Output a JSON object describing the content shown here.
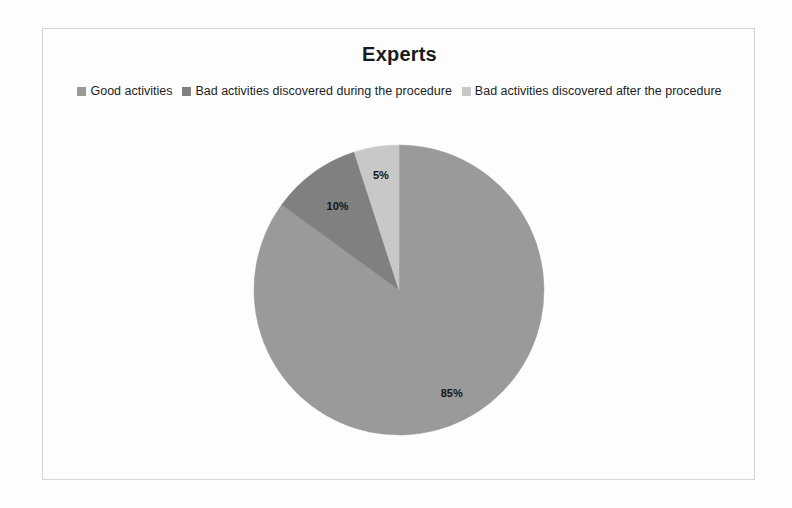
{
  "frame": {
    "border_color": "#d4d4d8",
    "background": "#ffffff"
  },
  "chart": {
    "title": "Experts"
  },
  "legend": {
    "position": "top",
    "entries": [
      {
        "label": "Good activities",
        "color": "#9a9a9a",
        "marker": "square-swatch-icon"
      },
      {
        "label": "Bad activities discovered during the procedure",
        "color": "#808080",
        "marker": "square-swatch-icon"
      },
      {
        "label": "Bad activities discovered after the procedure",
        "color": "#c8c8c8",
        "marker": "square-swatch-icon"
      }
    ]
  },
  "chart_data": {
    "type": "pie",
    "title": "Experts",
    "xlabel": "",
    "ylabel": "",
    "categories": [
      "Good activities",
      "Bad activities discovered during the procedure",
      "Bad activities discovered after the procedure"
    ],
    "values": [
      85,
      10,
      5
    ],
    "unit": "%",
    "data_labels": [
      "85%",
      "10%",
      "5%"
    ],
    "colors": [
      "#9a9a9a",
      "#808080",
      "#c8c8c8"
    ],
    "legend_position": "top",
    "grid": false,
    "start_angle_deg": 0,
    "direction": "clockwise",
    "slices": [
      {
        "name": "Good activities",
        "value": 85,
        "label": "85%",
        "color": "#9a9a9a"
      },
      {
        "name": "Bad activities discovered during the procedure",
        "value": 10,
        "label": "10%",
        "color": "#808080"
      },
      {
        "name": "Bad activities discovered after the procedure",
        "value": 5,
        "label": "5%",
        "color": "#c8c8c8"
      }
    ]
  },
  "labels": {
    "slice_85": "85%",
    "slice_10": "10%",
    "slice_5": "5%"
  }
}
